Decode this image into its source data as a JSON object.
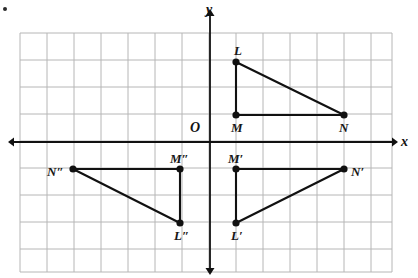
{
  "figure": {
    "type": "coordinate-geometry-diagram",
    "bullet_marker": "•",
    "axes": {
      "x_label": "x",
      "y_label": "y",
      "origin_label": "O",
      "x_axis_y_px": 142,
      "y_axis_x_px": 210,
      "color": "#111111"
    },
    "grid": {
      "left_px": 20,
      "top_px": 33,
      "right_px": 392,
      "bottom_px": 272,
      "cell_px": 27,
      "cols": 14,
      "rows": 9,
      "color": "#b6b6b6",
      "visible": true
    },
    "points": [
      {
        "name": "L",
        "label": "L",
        "x": 236,
        "y": 62,
        "label_dx": -2,
        "label_dy": -18,
        "grid_x": 1,
        "grid_y": 3
      },
      {
        "name": "M",
        "label": "M",
        "x": 236,
        "y": 115,
        "label_dx": -5,
        "label_dy": 6,
        "grid_x": 1,
        "grid_y": 1
      },
      {
        "name": "N",
        "label": "N",
        "x": 344,
        "y": 115,
        "label_dx": -5,
        "label_dy": 6,
        "grid_x": 5,
        "grid_y": 1
      },
      {
        "name": "Lp",
        "label": "L′",
        "x": 236,
        "y": 223,
        "label_dx": -5,
        "label_dy": 6,
        "grid_x": 1,
        "grid_y": -3
      },
      {
        "name": "Mp",
        "label": "M′",
        "x": 236,
        "y": 169,
        "label_dx": -8,
        "label_dy": -17,
        "grid_x": 1,
        "grid_y": -1
      },
      {
        "name": "Np",
        "label": "N′",
        "x": 344,
        "y": 169,
        "label_dx": 7,
        "label_dy": -4,
        "grid_x": 5,
        "grid_y": -1
      },
      {
        "name": "Lpp",
        "label": "L″",
        "x": 180,
        "y": 223,
        "label_dx": -6,
        "label_dy": 6,
        "grid_x": -1,
        "grid_y": -3
      },
      {
        "name": "Mpp",
        "label": "M″",
        "x": 180,
        "y": 169,
        "label_dx": -10,
        "label_dy": -17,
        "grid_x": -1,
        "grid_y": -1
      },
      {
        "name": "Npp",
        "label": "N″",
        "x": 73,
        "y": 169,
        "label_dx": -26,
        "label_dy": -4,
        "grid_x": -5,
        "grid_y": -1
      }
    ],
    "triangles": [
      {
        "name": "LMN",
        "vertices": [
          "L",
          "M",
          "N"
        ],
        "stroke": "#111111"
      },
      {
        "name": "L'M'N'",
        "vertices": [
          "Lp",
          "Mp",
          "Np"
        ],
        "stroke": "#111111"
      },
      {
        "name": "L''M''N''",
        "vertices": [
          "Lpp",
          "Mpp",
          "Npp"
        ],
        "stroke": "#111111"
      }
    ]
  }
}
